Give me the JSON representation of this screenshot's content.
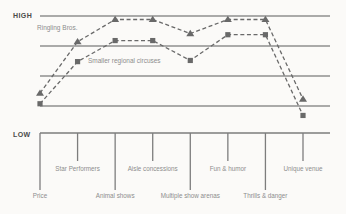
{
  "chart_data": {
    "type": "line",
    "categories": [
      "Price",
      "Star Performers",
      "Animal shows",
      "Aisle concessions",
      "Multiple show arenas",
      "Fun & humor",
      "Thrills & danger",
      "Unique venue"
    ],
    "y_axis": {
      "high": "HIGH",
      "low": "LOW"
    },
    "value_range": [
      0,
      100
    ],
    "gridlines": 4,
    "legend_position": "inline-on-chart",
    "series": [
      {
        "name": "Ringling Bros.",
        "marker": "triangle",
        "line_style": "dashed",
        "values": [
          34,
          78,
          97,
          97,
          85,
          97,
          97,
          29
        ]
      },
      {
        "name": "Smaller regional circuses",
        "marker": "square",
        "line_style": "dashed",
        "values": [
          25,
          61,
          79,
          79,
          62,
          84,
          84,
          15
        ]
      }
    ],
    "colors": {
      "line": "#696969",
      "grid": "#8f8f8f",
      "axis": "#7d7d7d",
      "text_dark": "#4a4a4a",
      "text_gray": "#8d8d8d",
      "background": "#fbfaf8"
    }
  }
}
